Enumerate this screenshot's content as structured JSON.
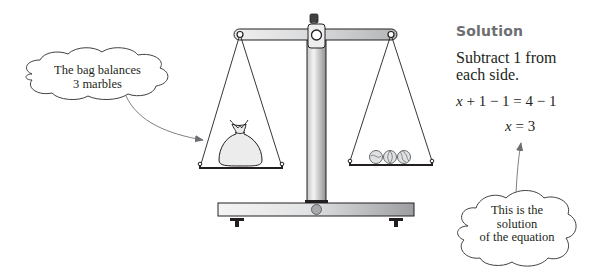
{
  "diagram": {
    "type": "balance-scale-equation",
    "scale": {
      "left_pan": {
        "item": "bag",
        "label": "bag"
      },
      "right_pan": {
        "items": [
          "marble",
          "marble",
          "marble"
        ],
        "count": 3
      }
    },
    "callouts": {
      "left": {
        "line1": "The bag balances",
        "line2": "3 marbles"
      },
      "right": {
        "line1": "This is the",
        "line2": "solution",
        "line3": "of the equation"
      }
    },
    "solution": {
      "heading": "Solution",
      "instruction_line1": "Subtract 1 from",
      "instruction_line2": "each side.",
      "equation1": {
        "var": "x",
        "rest": " + 1 − 1 = 4 − 1"
      },
      "equation2": {
        "var": "x",
        "rest": " = 3"
      }
    },
    "colors": {
      "outline": "#231f20",
      "metal_light": "#e6e7e8",
      "metal_dark": "#a7a9ac",
      "heading_gray": "#6d6e71",
      "arrow_gray": "#808285",
      "bag_fill": "#e8e8e8"
    }
  }
}
